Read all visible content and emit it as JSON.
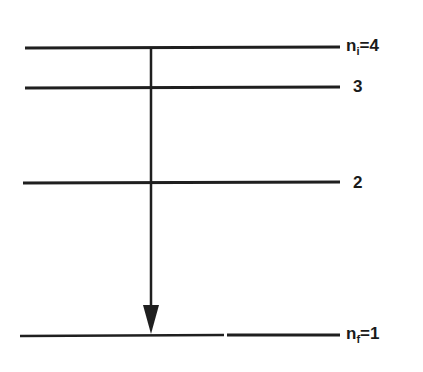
{
  "diagram": {
    "type": "energy-level-diagram",
    "line_color": "#1f1f1f",
    "levels": [
      {
        "n": "4",
        "label_prefix": "n",
        "label_sub": "i",
        "label_suffix": "=4",
        "y": 48
      },
      {
        "n": "3",
        "label": "3",
        "y": 88
      },
      {
        "n": "2",
        "label": "2",
        "y": 183
      },
      {
        "n": "1",
        "label_prefix": "n",
        "label_sub": "f",
        "label_suffix": "=1",
        "y": 336
      }
    ],
    "transition": {
      "from": "n_i=4",
      "to": "n_f=1",
      "direction": "down"
    }
  }
}
